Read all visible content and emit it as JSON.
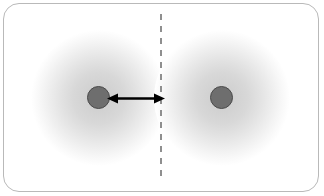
{
  "figure": {
    "title": "Atomic radius defined as half the internuclear distance between two touching atoms",
    "frame_border_color": "#b9b9b9",
    "background_color": "#ffffff"
  },
  "diagram": {
    "type": "schematic",
    "atoms": [
      {
        "id": "atom-left",
        "label": "",
        "nucleus": {
          "center_x": 98.5,
          "center_y": 97.5,
          "radius_px": 11.5,
          "fill_color": "#6e6e6e",
          "stroke_color": "#4a4a4a"
        },
        "electron_cloud": {
          "center_x": 99,
          "center_y": 98,
          "radius_px": 68,
          "inner_color": "#cfcfcf",
          "outer_color": "#ffffff"
        }
      },
      {
        "id": "atom-right",
        "label": "",
        "nucleus": {
          "center_x": 221.5,
          "center_y": 97.5,
          "radius_px": 11.5,
          "fill_color": "#6e6e6e",
          "stroke_color": "#4a4a4a"
        },
        "electron_cloud": {
          "center_x": 222,
          "center_y": 98,
          "radius_px": 68,
          "inner_color": "#cfcfcf",
          "outer_color": "#ffffff"
        }
      }
    ],
    "contact_plane": {
      "id": "divider-line",
      "label": "",
      "style": "dashed",
      "orientation": "vertical",
      "x": 161,
      "y_top": 14,
      "y_bottom": 182,
      "color": "#8f8f8f",
      "dash_length_px": 6,
      "gap_length_px": 6
    },
    "measurement_arrow": {
      "id": "radius-arrow",
      "label": "",
      "heads": "both",
      "color": "#000000",
      "x_start": 110,
      "x_end": 161,
      "y": 98
    }
  }
}
